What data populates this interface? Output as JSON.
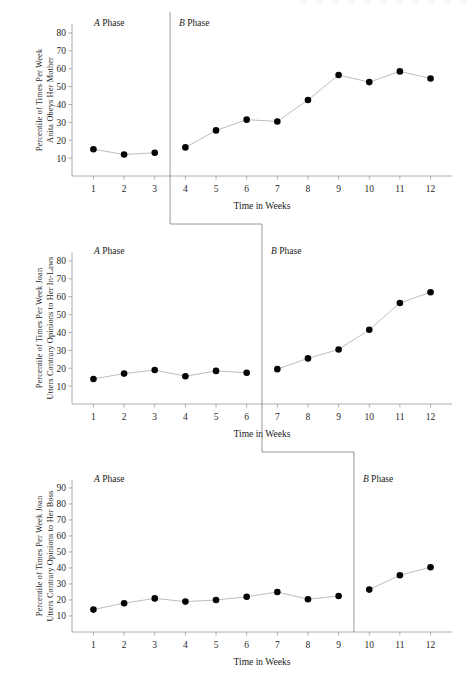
{
  "figure": {
    "kind": "multiple-baseline-ab-design",
    "shared_xlabel": "Time in Weeks",
    "phase_a_label_prefix": "A",
    "phase_b_label_prefix": "B",
    "phase_label_suffix": " Phase",
    "marker_color": "#050505",
    "line_color": "#b0b0b0",
    "axis_color": "#9a9a9a",
    "divider_color": "#8c8c8c"
  },
  "chart_data": [
    {
      "type": "line",
      "title": "",
      "ylabel_line1": "Percentile of Times Per Week",
      "ylabel_line2": "Anita Obeys Her Mother",
      "xlabel": "Time in Weeks",
      "categories": [
        1,
        2,
        3,
        4,
        5,
        6,
        7,
        8,
        9,
        10,
        11,
        12
      ],
      "xticklabels": [
        "1",
        "2",
        "3",
        "4",
        "5",
        "6",
        "7",
        "8",
        "9",
        "10",
        "11",
        "12"
      ],
      "yticks": [
        10,
        20,
        30,
        40,
        50,
        60,
        70,
        80
      ],
      "ylim": [
        0,
        85
      ],
      "xlim": [
        0.3,
        12.7
      ],
      "grid": false,
      "legend": "none",
      "phase_change_after_week": 3,
      "phase_a_label": "A Phase",
      "phase_b_label": "B Phase",
      "series": [
        {
          "name": "Anita obeys her mother",
          "phase_a_values": [
            15,
            12,
            13
          ],
          "phase_b_values": [
            16,
            25.5,
            31.5,
            30.5,
            42.5,
            56.5,
            52.5,
            58.5,
            54.5
          ],
          "values": [
            15,
            12,
            13,
            16,
            25.5,
            31.5,
            30.5,
            42.5,
            56.5,
            52.5,
            58.5,
            54.5
          ]
        }
      ]
    },
    {
      "type": "line",
      "title": "",
      "ylabel_line1": "Percentile of Times Per Week Joan",
      "ylabel_line2": "Utters Contrary Opinions to Her In-Laws",
      "xlabel": "Time in Weeks",
      "categories": [
        1,
        2,
        3,
        4,
        5,
        6,
        7,
        8,
        9,
        10,
        11,
        12
      ],
      "xticklabels": [
        "1",
        "2",
        "3",
        "4",
        "5",
        "6",
        "7",
        "8",
        "9",
        "10",
        "11",
        "12"
      ],
      "yticks": [
        10,
        20,
        30,
        40,
        50,
        60,
        70,
        80
      ],
      "ylim": [
        0,
        85
      ],
      "xlim": [
        0.3,
        12.7
      ],
      "grid": false,
      "legend": "none",
      "phase_change_after_week": 6,
      "phase_a_label": "A Phase",
      "phase_b_label": "B Phase",
      "series": [
        {
          "name": "Joan utters contrary opinions to her in-laws",
          "phase_a_values": [
            14,
            17,
            19,
            15.5,
            18.5,
            17.5
          ],
          "phase_b_values": [
            19.5,
            25.5,
            30.5,
            41.5,
            56.5,
            62.5
          ],
          "values": [
            14,
            17,
            19,
            15.5,
            18.5,
            17.5,
            19.5,
            25.5,
            30.5,
            41.5,
            56.5,
            62.5
          ]
        }
      ]
    },
    {
      "type": "line",
      "title": "",
      "ylabel_line1": "Percentile of Times Per Week Joan",
      "ylabel_line2": "Utters Contrary Opinions to Her Boss",
      "xlabel": "Time in Weeks",
      "categories": [
        1,
        2,
        3,
        4,
        5,
        6,
        7,
        8,
        9,
        10,
        11,
        12
      ],
      "xticklabels": [
        "1",
        "2",
        "3",
        "4",
        "5",
        "6",
        "7",
        "8",
        "9",
        "10",
        "11",
        "12"
      ],
      "yticks": [
        10,
        20,
        30,
        40,
        50,
        60,
        70,
        80,
        90
      ],
      "ylim": [
        0,
        95
      ],
      "xlim": [
        0.3,
        12.7
      ],
      "grid": false,
      "legend": "none",
      "phase_change_after_week": 9,
      "phase_a_label": "A Phase",
      "phase_b_label": "B Phase",
      "series": [
        {
          "name": "Joan utters contrary opinions to her boss",
          "phase_a_values": [
            14,
            18,
            21,
            19,
            20,
            22,
            25,
            20.5,
            22.5
          ],
          "phase_b_values": [
            26.5,
            35.5,
            40.5
          ],
          "values": [
            14,
            18,
            21,
            19,
            20,
            22,
            25,
            20.5,
            22.5,
            26.5,
            35.5,
            40.5
          ]
        }
      ]
    }
  ]
}
